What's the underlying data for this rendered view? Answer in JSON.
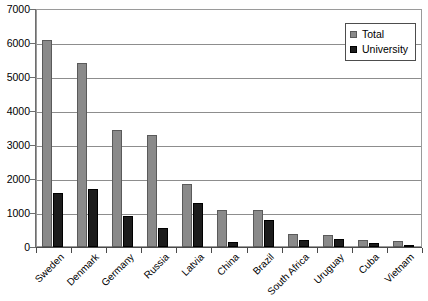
{
  "chart_data": {
    "type": "bar",
    "title": "",
    "subtitle": "",
    "xlabel": "",
    "ylabel": "",
    "ylim": [
      0,
      7000
    ],
    "ytick_step": 1000,
    "yticks": [
      7000,
      6000,
      5000,
      4000,
      3000,
      2000,
      1000,
      0
    ],
    "ytick_labels": [
      "7000",
      "6000",
      "5000",
      "4000",
      "3000",
      "2000",
      "1000",
      "0"
    ],
    "grid": true,
    "grid_axis": "y",
    "legend_position": "top-right",
    "categories": [
      "Sweden",
      "Denmark",
      "Germany",
      "Russia",
      "Latvia",
      "China",
      "Brazil",
      "South Africa",
      "Uruguay",
      "Cuba",
      "Vietnam"
    ],
    "series": [
      {
        "name": "Total",
        "color": "#8a8a8a",
        "values": [
          6100,
          5400,
          3450,
          3300,
          1850,
          1100,
          1080,
          380,
          350,
          220,
          170
        ]
      },
      {
        "name": "University",
        "color": "#1c1c1c",
        "values": [
          1600,
          1700,
          900,
          550,
          1300,
          150,
          780,
          220,
          230,
          130,
          30
        ]
      }
    ]
  },
  "legend": {
    "entries": [
      {
        "label": "Total",
        "swatch": "total-swatch"
      },
      {
        "label": "University",
        "swatch": "university-swatch"
      }
    ]
  }
}
